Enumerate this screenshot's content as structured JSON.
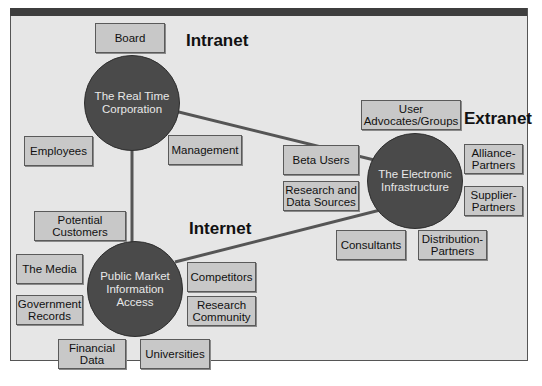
{
  "colors": {
    "background": "#e6e6e6",
    "circle": "#4a4a4a",
    "box": "#c8c8c8",
    "line": "#555555",
    "topbar": "#3e3e3e"
  },
  "zones": {
    "intranet": "Intranet",
    "extranet": "Extranet",
    "internet": "Internet"
  },
  "hubs": {
    "real_time": "The Real Time\nCorporation",
    "electronic": "The Electronic\nInfrastructure",
    "public": "Public Market\nInformation\nAccess"
  },
  "boxes": {
    "board": "Board",
    "employees": "Employees",
    "management": "Management",
    "user_advocates": "User\nAdvocates/Groups",
    "beta_users": "Beta Users",
    "research_data": "Research and\nData Sources",
    "alliance": "Alliance-\nPartners",
    "supplier": "Supplier-\nPartners",
    "consultants": "Consultants",
    "distribution": "Distribution-\nPartners",
    "potential_customers": "Potential\nCustomers",
    "media": "The Media",
    "government": "Government\nRecords",
    "competitors": "Competitors",
    "research_community": "Research\nCommunity",
    "financial": "Financial\nData",
    "universities": "Universities"
  }
}
